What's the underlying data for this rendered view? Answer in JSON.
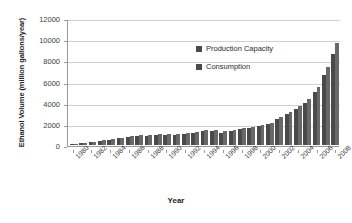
{
  "chart_data": {
    "type": "bar",
    "title": "",
    "xlabel": "Year",
    "ylabel": "Ethanol Volume (million gallons/year)",
    "ylim": [
      0,
      12000
    ],
    "ytick_labels": [
      "12000",
      "10000",
      "8000",
      "6000",
      "4000",
      "2000",
      "0"
    ],
    "ytick_values": [
      12000,
      10000,
      8000,
      6000,
      4000,
      2000,
      0
    ],
    "grid": true,
    "legend_position": "inside-top-center",
    "legend": [
      "Production Capacity",
      "Consumption"
    ],
    "categories": [
      1980,
      1981,
      1982,
      1983,
      1984,
      1985,
      1986,
      1987,
      1988,
      1989,
      1990,
      1991,
      1992,
      1993,
      1994,
      1995,
      1996,
      1997,
      1998,
      1999,
      2000,
      2001,
      2002,
      2003,
      2004,
      2005,
      2006,
      2007,
      2008
    ],
    "xtick_labels": [
      "1980",
      "1982",
      "1984",
      "1986",
      "1988",
      "1990",
      "1992",
      "1994",
      "1996",
      "1998",
      "2000",
      "2002",
      "2004",
      "2006",
      "2008"
    ],
    "series": [
      {
        "name": "Production Capacity",
        "values": [
          100,
          170,
          280,
          430,
          560,
          690,
          830,
          930,
          920,
          1010,
          1000,
          1060,
          1130,
          1230,
          1380,
          1450,
          1280,
          1420,
          1650,
          1740,
          1900,
          2120,
          2620,
          3100,
          3640,
          4340,
          5490,
          7390,
          9620
        ]
      },
      {
        "name": "Consumption",
        "values": [
          85,
          150,
          250,
          400,
          520,
          640,
          770,
          840,
          850,
          930,
          900,
          960,
          1030,
          1120,
          1280,
          1330,
          1150,
          1300,
          1500,
          1600,
          1750,
          1970,
          2420,
          2900,
          3400,
          4000,
          5000,
          6600,
          8600
        ]
      }
    ]
  }
}
